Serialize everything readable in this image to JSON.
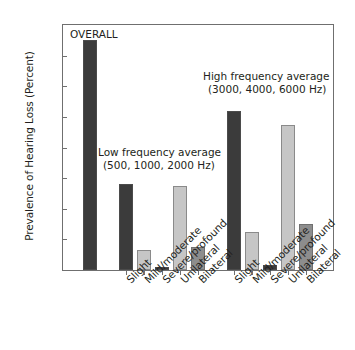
{
  "chart_data": {
    "type": "bar",
    "title": "",
    "xlabel": "",
    "ylabel": "Prevalence of Hearing Loss (Percent)",
    "ylim": [
      0,
      16
    ],
    "yticks": [
      0,
      2,
      4,
      6,
      8,
      10,
      12,
      14,
      16
    ],
    "grid": false,
    "legend": "none",
    "annotations": [
      {
        "name": "overall-label",
        "text": "OVERALL"
      },
      {
        "name": "low-frequency-label-line1",
        "text": "Low frequency average"
      },
      {
        "name": "low-frequency-label-line2",
        "text": "(500, 1000, 2000 Hz)"
      },
      {
        "name": "high-frequency-label-line1",
        "text": "High frequency average"
      },
      {
        "name": "high-frequency-label-line2",
        "text": "(3000, 4000, 6000 Hz)"
      }
    ],
    "categories": [
      "OVERALL",
      "Slight",
      "Mild/moderate",
      "Severe/profound",
      "Unilateral",
      "Bilateral",
      "Slight",
      "Mild/moderate",
      "Severe/profound",
      "Unilateral",
      "Bilateral"
    ],
    "values": [
      15.0,
      5.6,
      1.3,
      0.2,
      5.5,
      1.5,
      10.4,
      2.5,
      0.3,
      9.5,
      3.0
    ],
    "bar_colors": [
      "#3b3b3b",
      "#3b3b3b",
      "#c6c6c6",
      "#3b3b3b",
      "#c6c6c6",
      "#8d8d8d",
      "#3b3b3b",
      "#c6c6c6",
      "#3b3b3b",
      "#c6c6c6",
      "#8d8d8d"
    ],
    "groups": [
      {
        "name": "overall",
        "label": "OVERALL",
        "indices": [
          0
        ]
      },
      {
        "name": "low-frequency-average",
        "label": "Low frequency average (500, 1000, 2000 Hz)",
        "indices": [
          1,
          2,
          3,
          4,
          5
        ]
      },
      {
        "name": "high-frequency-average",
        "label": "High frequency average (3000, 4000, 6000 Hz)",
        "indices": [
          6,
          7,
          8,
          9,
          10
        ]
      }
    ],
    "xtick_labels": [
      "Slight",
      "Mild/moderate",
      "Severe/profound",
      "Unilateral",
      "Bilateral",
      "Slight",
      "Mild/moderate",
      "Severe/profound",
      "Unilateral",
      "Bilateral"
    ],
    "colors": {
      "dark": "#3b3b3b",
      "light": "#c6c6c6",
      "medium": "#8d8d8d",
      "axis": "#6f6f6f",
      "text": "#231f20",
      "background": "#ffffff"
    }
  }
}
